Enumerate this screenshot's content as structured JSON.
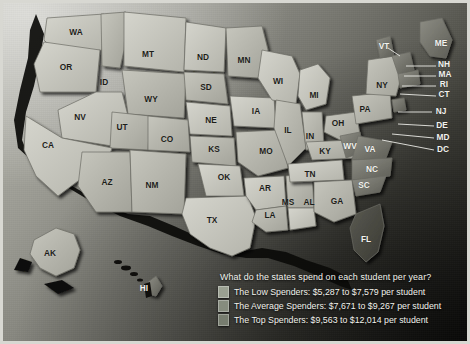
{
  "legend": {
    "question": "What do the states spend on each student per year?",
    "rows": [
      {
        "label": "The Low Spenders: $5,287 to $7,579 per student",
        "color": "#9aa091"
      },
      {
        "label": "The Average Spenders: $7,671 to $9,267 per student",
        "color": "#868c7e"
      },
      {
        "label": "The Top Spenders: $9,563 to $12,014 per student",
        "color": "#777d6f"
      }
    ]
  },
  "map": {
    "states": [
      {
        "code": "WA",
        "x": 76,
        "y": 33,
        "dark": false
      },
      {
        "code": "OR",
        "x": 66,
        "y": 68,
        "dark": false
      },
      {
        "code": "ID",
        "x": 104,
        "y": 83,
        "dark": false
      },
      {
        "code": "MT",
        "x": 148,
        "y": 55,
        "dark": false
      },
      {
        "code": "WY",
        "x": 151,
        "y": 100,
        "dark": false
      },
      {
        "code": "NV",
        "x": 80,
        "y": 118,
        "dark": false
      },
      {
        "code": "UT",
        "x": 122,
        "y": 128,
        "dark": false
      },
      {
        "code": "CA",
        "x": 48,
        "y": 146,
        "dark": false
      },
      {
        "code": "AZ",
        "x": 107,
        "y": 183,
        "dark": false
      },
      {
        "code": "NM",
        "x": 152,
        "y": 186,
        "dark": false
      },
      {
        "code": "CO",
        "x": 167,
        "y": 140,
        "dark": false
      },
      {
        "code": "ND",
        "x": 203,
        "y": 58,
        "dark": false
      },
      {
        "code": "SD",
        "x": 206,
        "y": 88,
        "dark": false
      },
      {
        "code": "NE",
        "x": 211,
        "y": 121,
        "dark": false
      },
      {
        "code": "KS",
        "x": 214,
        "y": 150,
        "dark": false
      },
      {
        "code": "OK",
        "x": 224,
        "y": 178,
        "dark": false
      },
      {
        "code": "TX",
        "x": 212,
        "y": 221,
        "dark": false
      },
      {
        "code": "MN",
        "x": 244,
        "y": 61,
        "dark": false
      },
      {
        "code": "IA",
        "x": 256,
        "y": 112,
        "dark": false
      },
      {
        "code": "MO",
        "x": 266,
        "y": 152,
        "dark": false
      },
      {
        "code": "AR",
        "x": 265,
        "y": 189,
        "dark": false
      },
      {
        "code": "LA",
        "x": 270,
        "y": 216,
        "dark": false
      },
      {
        "code": "WI",
        "x": 278,
        "y": 82,
        "dark": false
      },
      {
        "code": "IL",
        "x": 288,
        "y": 131,
        "dark": false
      },
      {
        "code": "MS",
        "x": 288,
        "y": 203,
        "dark": false
      },
      {
        "code": "MI",
        "x": 314,
        "y": 96,
        "dark": false
      },
      {
        "code": "IN",
        "x": 310,
        "y": 137,
        "dark": false
      },
      {
        "code": "KY",
        "x": 325,
        "y": 152,
        "dark": false
      },
      {
        "code": "TN",
        "x": 310,
        "y": 175,
        "dark": false
      },
      {
        "code": "AL",
        "x": 309,
        "y": 203,
        "dark": false
      },
      {
        "code": "GA",
        "x": 337,
        "y": 202,
        "dark": false
      },
      {
        "code": "OH",
        "x": 338,
        "y": 124,
        "dark": false
      },
      {
        "code": "WV",
        "x": 350,
        "y": 147,
        "dark": true
      },
      {
        "code": "VA",
        "x": 370,
        "y": 150,
        "dark": true
      },
      {
        "code": "NC",
        "x": 372,
        "y": 170,
        "dark": true
      },
      {
        "code": "SC",
        "x": 364,
        "y": 186,
        "dark": true
      },
      {
        "code": "FL",
        "x": 366,
        "y": 240,
        "dark": true
      },
      {
        "code": "PA",
        "x": 365,
        "y": 110,
        "dark": false
      },
      {
        "code": "NY",
        "x": 382,
        "y": 86,
        "dark": false
      },
      {
        "code": "VT",
        "x": 384,
        "y": 47,
        "dark": true
      },
      {
        "code": "ME",
        "x": 441,
        "y": 44,
        "dark": true
      },
      {
        "code": "AK",
        "x": 50,
        "y": 254,
        "dark": false
      },
      {
        "code": "HI",
        "x": 144,
        "y": 289,
        "dark": true
      }
    ],
    "callouts": [
      {
        "code": "NH",
        "x": 444,
        "y": 65
      },
      {
        "code": "MA",
        "x": 445,
        "y": 75
      },
      {
        "code": "RI",
        "x": 444,
        "y": 85
      },
      {
        "code": "CT",
        "x": 444,
        "y": 95
      },
      {
        "code": "NJ",
        "x": 441,
        "y": 112
      },
      {
        "code": "DE",
        "x": 442,
        "y": 126
      },
      {
        "code": "MD",
        "x": 443,
        "y": 138
      },
      {
        "code": "DC",
        "x": 443,
        "y": 150
      }
    ]
  }
}
